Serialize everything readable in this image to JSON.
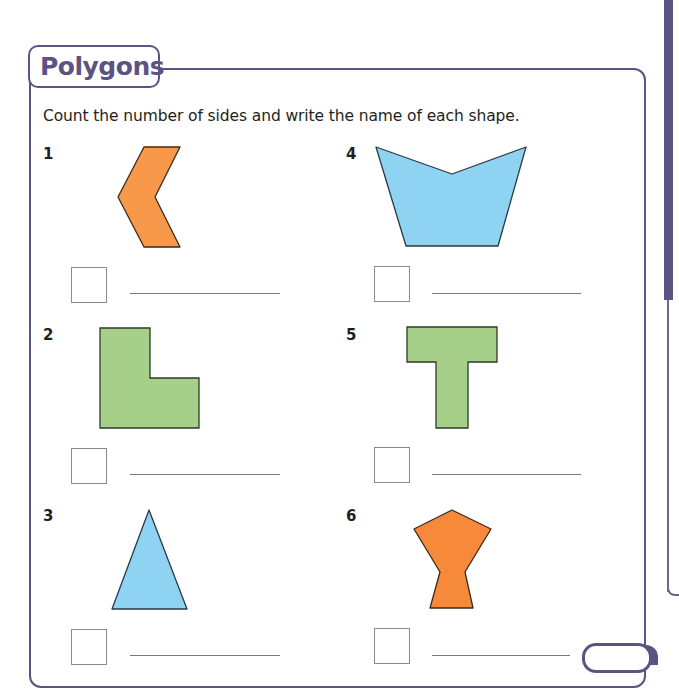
{
  "worksheet": {
    "title": "Polygons",
    "instructions": "Count the number of sides and write the name of each shape.",
    "accent_color": "#5b5483",
    "questions": [
      {
        "number": "1",
        "shape": "chevron-hexagon",
        "fill": "#f7984a",
        "sides_answer": "",
        "name_answer": ""
      },
      {
        "number": "2",
        "shape": "l-hexagon",
        "fill": "#a6d08a",
        "sides_answer": "",
        "name_answer": ""
      },
      {
        "number": "3",
        "shape": "triangle",
        "fill": "#8fd3f2",
        "sides_answer": "",
        "name_answer": ""
      },
      {
        "number": "4",
        "shape": "concave-pentagon",
        "fill": "#8fd3f2",
        "sides_answer": "",
        "name_answer": ""
      },
      {
        "number": "5",
        "shape": "t-octagon",
        "fill": "#a6d08a",
        "sides_answer": "",
        "name_answer": ""
      },
      {
        "number": "6",
        "shape": "heptagon",
        "fill": "#f7893a",
        "sides_answer": "",
        "name_answer": ""
      }
    ]
  }
}
